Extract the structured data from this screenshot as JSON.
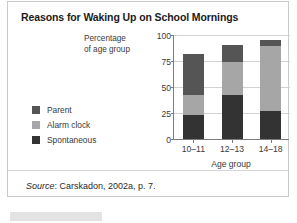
{
  "figure": {
    "title": "Reasons for Waking Up on School Mornings",
    "source_prefix": "Source",
    "source_text": ": Carskadon, 2002a, p. 7."
  },
  "colors": {
    "parent": "#555555",
    "alarm_clock": "#a6a6a6",
    "spontaneous": "#333333",
    "gridline": "#d2d2d2",
    "axis": "#7d7d7d",
    "card_border": "#c9c9c9",
    "text": "#3a3a3a",
    "title_text": "#1b1b1b"
  },
  "chart_data": {
    "type": "bar",
    "stacked": true,
    "title": "Reasons for Waking Up on School Mornings",
    "xlabel": "Age group",
    "ylabel_line1": "Percentage",
    "ylabel_line2": "of age group",
    "categories": [
      "10–11",
      "12–13",
      "14–18"
    ],
    "ylim": [
      0,
      100
    ],
    "yticks": [
      0,
      25,
      50,
      75,
      100
    ],
    "ytick_labels": [
      "0",
      "25",
      "50",
      "75",
      "100"
    ],
    "grid": true,
    "legend_position": "left",
    "series": [
      {
        "name": "Spontaneous",
        "color": "#333333",
        "values": [
          23,
          42,
          27
        ]
      },
      {
        "name": "Alarm clock",
        "color": "#a6a6a6",
        "values": [
          19,
          32,
          62
        ]
      },
      {
        "name": "Parent",
        "color": "#555555",
        "values": [
          40,
          16,
          6
        ]
      }
    ],
    "cumulative_tops": [
      {
        "category": "10–11",
        "spontaneous": 23,
        "alarm_clock": 42,
        "parent": 82
      },
      {
        "category": "12–13",
        "spontaneous": 42,
        "alarm_clock": 74,
        "parent": 90
      },
      {
        "category": "14–18",
        "spontaneous": 27,
        "alarm_clock": 89,
        "parent": 95
      }
    ],
    "legend_order": [
      "Parent",
      "Alarm clock",
      "Spontaneous"
    ]
  }
}
